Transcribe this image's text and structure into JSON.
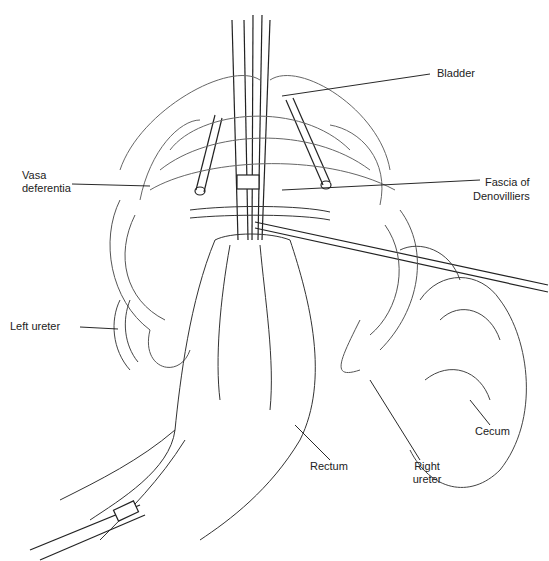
{
  "figure": {
    "labels": {
      "bladder": "Bladder",
      "vasa_deferentia_line1": "Vasa",
      "vasa_deferentia_line2": "deferentia",
      "fascia_line1": "Fascia of",
      "fascia_line2": "Denovilliers",
      "left_ureter": "Left ureter",
      "cecum": "Cecum",
      "rectum": "Rectum",
      "right_ureter_line1": "Right",
      "right_ureter_line2": "ureter"
    },
    "colors": {
      "line": "#222222",
      "fine_line": "#555555",
      "background": "#ffffff"
    }
  }
}
